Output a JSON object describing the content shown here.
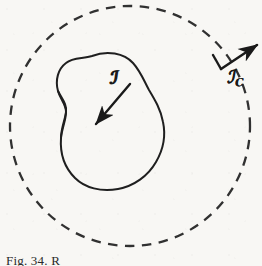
{
  "figure": {
    "background_color": "#f8f7f4",
    "ink_color": "#1a1a1a",
    "caption": "Fig. 34. R",
    "caption_note": "caption cropped at bottom edge of image",
    "labels": {
      "inner_vector": "ℐ",
      "inner_vector_plain": "S",
      "outer_vector": "ℐ",
      "outer_vector_plain": "S",
      "outer_vector_subscript": "C"
    },
    "elements": {
      "dashed_circle_name": "dashed-boundary-circle",
      "blob_name": "closed-surface-outline",
      "inner_arrow_name": "inward-normal-vector-arrow",
      "outer_arrow_name": "outward-normal-vector-arrow"
    }
  },
  "geometry": {
    "circle": {
      "cx": 130,
      "cy": 126,
      "r": 120,
      "dash": "9 7",
      "stroke_width": 2.2
    },
    "blob_stroke_width": 2.0,
    "inner_arrow": {
      "x1": 128,
      "y1": 86,
      "x2": 95,
      "y2": 124
    },
    "outer_arrow": {
      "x1": 222,
      "y1": 68,
      "x2": 258,
      "y2": 44
    },
    "outer_tick": {
      "x1": 214,
      "y1": 56,
      "x2": 222,
      "y2": 68
    }
  }
}
